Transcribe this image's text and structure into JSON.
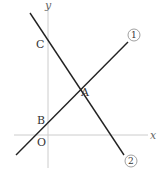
{
  "diagram": {
    "axes": {
      "x_label": "x",
      "y_label": "y",
      "origin_label": "O"
    },
    "points": {
      "A": "A",
      "B": "B",
      "C": "C"
    },
    "lines": [
      {
        "id": "line-1",
        "label": "1",
        "from": [
          16,
          155
        ],
        "to": [
          128,
          42
        ]
      },
      {
        "id": "line-2",
        "label": "2",
        "from": [
          30,
          13
        ],
        "to": [
          124,
          155
        ]
      }
    ],
    "colors": {
      "line": "#222222",
      "axis": "#cccccc"
    }
  }
}
